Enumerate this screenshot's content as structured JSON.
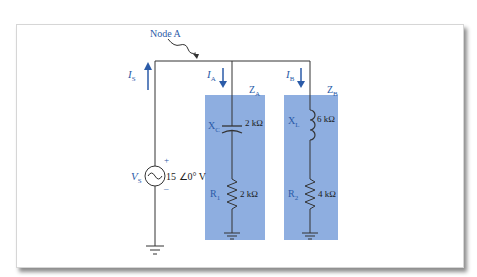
{
  "diagram": {
    "type": "ac-parallel-circuit",
    "node_label": "Node A",
    "source": {
      "name": "V",
      "subscript": "S",
      "value": "15 ∠0° V",
      "plus": "+",
      "minus": "–"
    },
    "currents": {
      "source": {
        "name": "I",
        "subscript": "S"
      },
      "branch_a": {
        "name": "I",
        "subscript": "A"
      },
      "branch_b": {
        "name": "I",
        "subscript": "B"
      }
    },
    "branch_a": {
      "impedance": {
        "name": "Z",
        "subscript": "A"
      },
      "capacitor": {
        "name": "X",
        "subscript": "C",
        "value": "2 kΩ"
      },
      "resistor": {
        "name": "R",
        "subscript": "1",
        "value": "2 kΩ"
      }
    },
    "branch_b": {
      "impedance": {
        "name": "Z",
        "subscript": "B"
      },
      "inductor": {
        "name": "X",
        "subscript": "L",
        "value": "6 kΩ"
      },
      "resistor": {
        "name": "R",
        "subscript": "2",
        "value": "4 kΩ"
      }
    },
    "colors": {
      "wire": "#333333",
      "label_blue": "#2b5ba8",
      "box_fill": "#8eaee0",
      "arrow": "#2b5ba8"
    }
  }
}
